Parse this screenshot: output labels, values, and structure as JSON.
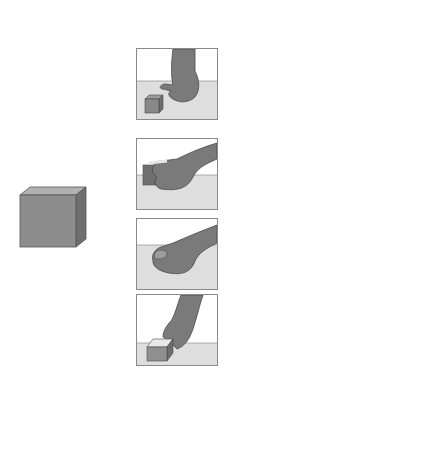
{
  "cube": {
    "label_line1": "1 inch",
    "label_line2": "cube",
    "color_front": "#8d8d8d",
    "color_top": "#b2b2b2",
    "color_side": "#6f6f6f"
  },
  "panels": [
    {
      "name": "no-contact",
      "description": "hand reaching toward cube"
    },
    {
      "name": "entire-hand",
      "description": "hand grasping cube with entire hand"
    },
    {
      "name": "adjust-hand",
      "description": "hand adjusting position around cube"
    },
    {
      "name": "thumb-on-top",
      "description": "hand grasping cube with fingers"
    }
  ],
  "arrow": {
    "fill": "#e4e4e4",
    "stroke": "#555555",
    "items": [
      {
        "text": "Age",
        "bold": true
      },
      {
        "text": "Birth",
        "bold": true
      },
      {
        "text": "No contact",
        "bold": false
      },
      {
        "text": "1 month",
        "bold": true
      },
      {
        "text": "Limited contact",
        "bold": false
      },
      {
        "text": "2 months",
        "bold": true
      },
      {
        "text": "Grasp with",
        "bold": false
      },
      {
        "text": "entire hand",
        "bold": false
      },
      {
        "text": "3 months",
        "bold": true
      },
      {
        "text": "Adjust hand",
        "bold": false
      },
      {
        "text": "position",
        "bold": false
      },
      {
        "text": "4 months",
        "bold": true
      },
      {
        "text": "Grasp with",
        "bold": false
      },
      {
        "text": "thumb on top",
        "bold": false
      },
      {
        "text": "5 months",
        "bold": true
      },
      {
        "text": "Grasp with",
        "bold": false
      },
      {
        "text": "fingers only",
        "bold": false
      }
    ]
  }
}
